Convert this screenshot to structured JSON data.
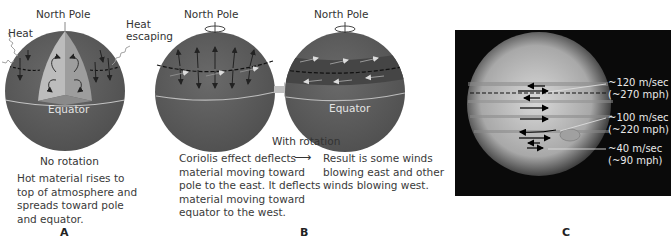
{
  "panels": {
    "a": {
      "letter": "A",
      "north_pole": "North Pole",
      "heat": "Heat",
      "heat_escaping_line1": "Heat",
      "heat_escaping_line2": "escaping",
      "equator": "Equator",
      "subtitle": "No rotation",
      "caption_lines": [
        "Hot material rises to",
        "top of atmosphere and",
        "spreads toward pole",
        "and equator."
      ]
    },
    "b": {
      "letter": "B",
      "north_pole_left": "North Pole",
      "north_pole_right": "North Pole",
      "equator": "Equator",
      "subtitle": "With rotation",
      "caption_left_lines": [
        "Coriolis effect deflects",
        "material moving toward",
        "pole to the east. It deflects",
        "material moving toward",
        "equator to the west."
      ],
      "arrow_glyph": "⟶",
      "caption_right_lines": [
        "Result is some winds",
        "blowing east and other",
        "winds blowing west."
      ]
    },
    "c": {
      "letter": "C",
      "wind_labels": [
        {
          "speed": "~120 m/sec",
          "mph": "(~270 mph)"
        },
        {
          "speed": "~100 m/sec",
          "mph": "(~220 mph)"
        },
        {
          "speed": "~40 m/sec",
          "mph": "(~90 mph)"
        }
      ]
    }
  },
  "colors": {
    "sphere": "#5e5e5e",
    "sphere_dark": "#4a4a4a",
    "cutaway_light": "#b9b9b9",
    "cutaway_mid": "#9a9a9a",
    "equator_line": "#bdbdbd",
    "band": "#474747",
    "photo_bg": "#0a0a0a"
  }
}
